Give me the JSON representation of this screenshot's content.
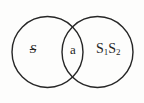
{
  "figure": {
    "type": "venn-diagram",
    "background_color": "#fdfdfc",
    "stroke_color": "#262626",
    "stroke_width": 1.4,
    "title": "",
    "circles": [
      {
        "name": "left-circle",
        "center_x": 47.5,
        "center_y": 52,
        "radius": 35.5,
        "label": "S"
      },
      {
        "name": "right-circle",
        "center_x": 97.5,
        "center_y": 52,
        "radius": 35.5,
        "label": "S1S2"
      }
    ],
    "regions": {
      "left_only": {
        "label": "S",
        "struck_through": true,
        "x": 33,
        "y": 52
      },
      "intersection": {
        "label": "a",
        "x": 73,
        "y": 52
      },
      "right_only": {
        "label_base_1": "S",
        "label_sub_1": "1",
        "label_base_2": "S",
        "label_sub_2": "2",
        "x": 112,
        "y": 52
      }
    }
  }
}
